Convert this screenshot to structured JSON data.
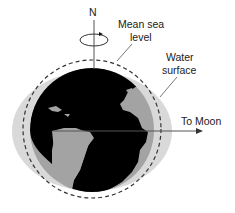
{
  "diagram": {
    "labels": {
      "north": "N",
      "mean_sea_level_line1": "Mean sea",
      "mean_sea_level_line2": "level",
      "water_surface_line1": "Water",
      "water_surface_line2": "surface",
      "to_moon": "To Moon"
    },
    "colors": {
      "land": "#a0a0a0",
      "ocean": "#000000",
      "water_bulge": "#d8d8d8",
      "lines": "#333333"
    }
  }
}
